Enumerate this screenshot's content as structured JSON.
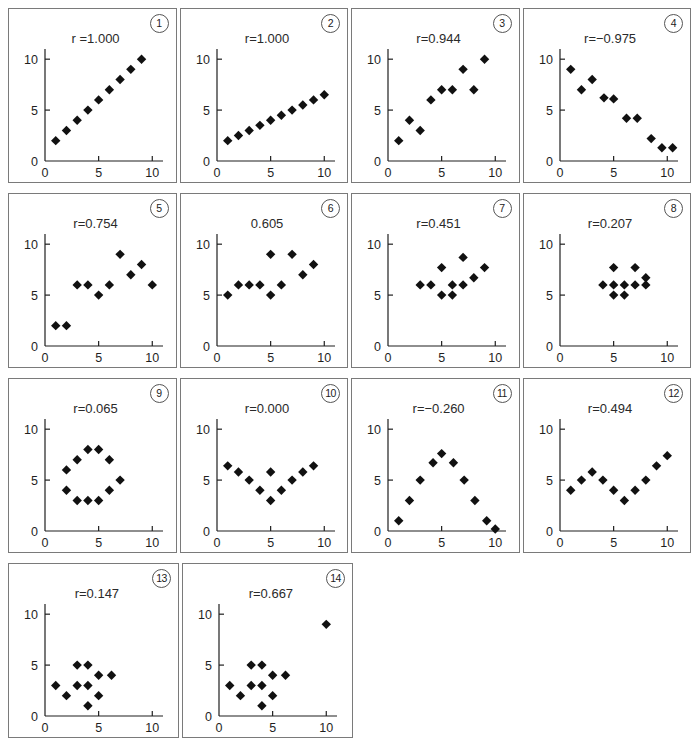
{
  "figure": {
    "title": "",
    "panel_count": 14,
    "columns": 4,
    "rows": 4,
    "axis": {
      "xticks": [
        0,
        5,
        10
      ],
      "yticks": [
        0,
        5,
        10
      ],
      "xtick_labels": [
        "0",
        "5",
        "10"
      ],
      "ytick_labels": [
        "0",
        "5",
        "10"
      ],
      "xlim": [
        0,
        11
      ],
      "ylim": [
        0,
        11
      ],
      "grid": false
    },
    "marker": {
      "shape": "diamond",
      "color": "#111111",
      "size": 7
    },
    "border_color": "#7a7a7a"
  },
  "chart_data": [
    {
      "type": "scatter",
      "index": "1",
      "index_label": "①",
      "title": "r =1.000",
      "r": 1.0,
      "xlabel": "",
      "ylabel": "",
      "xlim": [
        0,
        11
      ],
      "ylim": [
        0,
        11
      ],
      "grid": false,
      "x": [
        1,
        2,
        3,
        4,
        5,
        6,
        7,
        8,
        9
      ],
      "y": [
        2,
        3,
        4,
        5,
        6,
        7,
        8,
        9,
        10
      ]
    },
    {
      "type": "scatter",
      "index": "2",
      "index_label": "②",
      "title": "r=1.000",
      "r": 1.0,
      "xlabel": "",
      "ylabel": "",
      "xlim": [
        0,
        11
      ],
      "ylim": [
        0,
        11
      ],
      "grid": false,
      "x": [
        1,
        2,
        3,
        4,
        5,
        6,
        7,
        8,
        9,
        10
      ],
      "y": [
        2.0,
        2.5,
        3.0,
        3.5,
        4.0,
        4.5,
        5.0,
        5.5,
        6.0,
        6.5
      ]
    },
    {
      "type": "scatter",
      "index": "3",
      "index_label": "③",
      "title": "r=0.944",
      "r": 0.944,
      "xlabel": "",
      "ylabel": "",
      "xlim": [
        0,
        11
      ],
      "ylim": [
        0,
        11
      ],
      "grid": false,
      "x": [
        1,
        2,
        3,
        4,
        5,
        6,
        7,
        8,
        9
      ],
      "y": [
        2,
        4,
        3,
        6,
        7,
        7,
        9,
        7,
        10
      ]
    },
    {
      "type": "scatter",
      "index": "4",
      "index_label": "④",
      "title": "r=−0.975",
      "r": -0.975,
      "xlabel": "",
      "ylabel": "",
      "xlim": [
        0,
        11
      ],
      "ylim": [
        0,
        11
      ],
      "grid": false,
      "x": [
        1.0,
        2.0,
        3.0,
        4.1,
        5.0,
        6.2,
        7.2,
        8.5,
        9.5,
        10.5
      ],
      "y": [
        9.0,
        7.0,
        8.0,
        6.2,
        6.1,
        4.2,
        4.2,
        2.2,
        1.3,
        1.3
      ]
    },
    {
      "type": "scatter",
      "index": "5",
      "index_label": "⑤",
      "title": "r=0.754",
      "r": 0.754,
      "xlabel": "",
      "ylabel": "",
      "xlim": [
        0,
        11
      ],
      "ylim": [
        0,
        11
      ],
      "grid": false,
      "x": [
        1,
        2,
        3,
        4,
        5,
        6,
        7,
        8,
        9,
        10
      ],
      "y": [
        2,
        2,
        6,
        6,
        5,
        6,
        9,
        7,
        8,
        6
      ]
    },
    {
      "type": "scatter",
      "index": "6",
      "index_label": "⑥",
      "title": "0.605",
      "r": 0.605,
      "xlabel": "",
      "ylabel": "",
      "xlim": [
        0,
        11
      ],
      "ylim": [
        0,
        11
      ],
      "grid": false,
      "x": [
        1,
        2,
        3,
        4,
        5,
        5,
        6,
        7,
        8,
        9
      ],
      "y": [
        5,
        6,
        6,
        6,
        5,
        9,
        6,
        9,
        7,
        8
      ]
    },
    {
      "type": "scatter",
      "index": "7",
      "index_label": "⑦",
      "title": "r=0.451",
      "r": 0.451,
      "xlabel": "",
      "ylabel": "",
      "xlim": [
        0,
        11
      ],
      "ylim": [
        0,
        11
      ],
      "grid": false,
      "x": [
        3,
        4,
        5,
        5,
        6,
        6,
        7,
        7,
        8,
        9
      ],
      "y": [
        6,
        6,
        5,
        7.7,
        6,
        5,
        6,
        8.7,
        6.7,
        7.7
      ]
    },
    {
      "type": "scatter",
      "index": "8",
      "index_label": "⑧",
      "title": "r=0.207",
      "r": 0.207,
      "xlabel": "",
      "ylabel": "",
      "xlim": [
        0,
        11
      ],
      "ylim": [
        0,
        11
      ],
      "grid": false,
      "x": [
        4,
        5,
        5,
        5,
        6,
        6,
        7,
        7,
        8,
        8
      ],
      "y": [
        6,
        6,
        5,
        7.7,
        6,
        5,
        6,
        7.7,
        6,
        6.7
      ]
    },
    {
      "type": "scatter",
      "index": "9",
      "index_label": "⑨",
      "title": "r=0.065",
      "r": 0.065,
      "xlabel": "",
      "ylabel": "",
      "xlim": [
        0,
        11
      ],
      "ylim": [
        0,
        11
      ],
      "grid": false,
      "x": [
        2,
        2,
        3,
        3,
        4,
        4,
        5,
        5,
        6,
        6,
        7
      ],
      "y": [
        6,
        4,
        7,
        3,
        8,
        3,
        8,
        3,
        7,
        4,
        5
      ]
    },
    {
      "type": "scatter",
      "index": "10",
      "index_label": "⑩",
      "title": "r=0.000",
      "r": 0.0,
      "xlabel": "",
      "ylabel": "",
      "xlim": [
        0,
        11
      ],
      "ylim": [
        0,
        11
      ],
      "grid": false,
      "x": [
        1,
        2,
        3,
        4,
        5,
        5,
        6,
        7,
        8,
        9
      ],
      "y": [
        6.4,
        5.8,
        5.0,
        4.0,
        3.0,
        5.8,
        4.0,
        5.0,
        5.8,
        6.4
      ]
    },
    {
      "type": "scatter",
      "index": "11",
      "index_label": "⑪",
      "title": "r=−0.260",
      "r": -0.26,
      "xlabel": "",
      "ylabel": "",
      "xlim": [
        0,
        11
      ],
      "ylim": [
        0,
        11
      ],
      "grid": false,
      "x": [
        1,
        2,
        3,
        4.2,
        5,
        6.1,
        7.1,
        8.1,
        9.2,
        10
      ],
      "y": [
        1.0,
        3.0,
        5.0,
        6.7,
        7.6,
        6.7,
        5.0,
        3.0,
        1.0,
        0.2
      ]
    },
    {
      "type": "scatter",
      "index": "12",
      "index_label": "⑫",
      "title": "r=0.494",
      "r": 0.494,
      "xlabel": "",
      "ylabel": "",
      "xlim": [
        0,
        11
      ],
      "ylim": [
        0,
        11
      ],
      "grid": false,
      "x": [
        1,
        2,
        3,
        4,
        5,
        6,
        7,
        8,
        9,
        10
      ],
      "y": [
        4.0,
        5.0,
        5.8,
        5.0,
        4.0,
        3.0,
        4.0,
        5.0,
        6.4,
        7.4
      ]
    },
    {
      "type": "scatter",
      "index": "13",
      "index_label": "⑬",
      "title": "r=0.147",
      "r": 0.147,
      "xlabel": "",
      "ylabel": "",
      "xlim": [
        0,
        11
      ],
      "ylim": [
        0,
        11
      ],
      "grid": false,
      "x": [
        1,
        2,
        3,
        3,
        4,
        4,
        4,
        5,
        5,
        6.2
      ],
      "y": [
        3,
        2,
        5,
        3,
        5,
        3,
        1,
        4,
        2,
        4
      ]
    },
    {
      "type": "scatter",
      "index": "14",
      "index_label": "⑭",
      "title": "r=0.667",
      "r": 0.667,
      "xlabel": "",
      "ylabel": "",
      "xlim": [
        0,
        11
      ],
      "ylim": [
        0,
        11
      ],
      "grid": false,
      "x": [
        1,
        2,
        3,
        3,
        4,
        4,
        4,
        5,
        5,
        6.2,
        10
      ],
      "y": [
        3,
        2,
        5,
        3,
        5,
        3,
        1,
        4,
        2,
        4,
        9
      ]
    }
  ]
}
